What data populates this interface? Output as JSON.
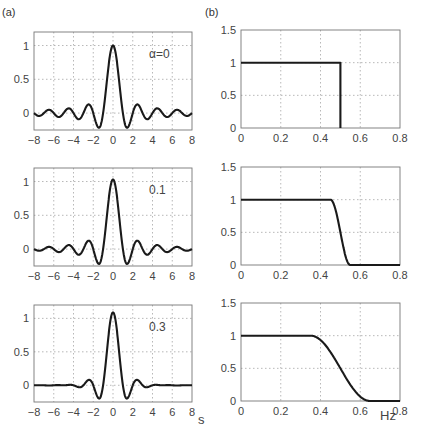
{
  "labels": {
    "panel_a": "(a)",
    "panel_b": "(b)",
    "x_left": "s",
    "x_right": "Hz"
  },
  "chart_data": [
    {
      "id": "a1",
      "type": "line",
      "panel": "(a)",
      "annotation": "α=0",
      "x_ticks": [
        "-8",
        "-6",
        "-4",
        "-2",
        "0",
        "2",
        "4",
        "6",
        "8"
      ],
      "y_ticks": [
        "0",
        "0.5",
        "1"
      ],
      "xlim": [
        -8,
        8
      ],
      "ylim": [
        -0.25,
        1.2
      ],
      "grid": true,
      "alpha": 0,
      "function": "sinc(x) * cos(pi*alpha*x)/(1-(2*alpha*x)^2), impulse response"
    },
    {
      "id": "b1",
      "type": "line",
      "panel": "(b)",
      "x_ticks": [
        "0",
        "0.2",
        "0.4",
        "0.6",
        "0.8"
      ],
      "y_ticks": [
        "0",
        "0.5",
        "1",
        "1.5"
      ],
      "xlim": [
        0,
        0.8
      ],
      "ylim": [
        0,
        1.5
      ],
      "grid": true,
      "alpha": 0,
      "function": "raised-cosine spectrum, cutoff 0.5 Hz"
    },
    {
      "id": "a2",
      "type": "line",
      "annotation": "0.1",
      "x_ticks": [
        "-8",
        "-6",
        "-4",
        "-2",
        "0",
        "2",
        "4",
        "6",
        "8"
      ],
      "y_ticks": [
        "0",
        "0.5",
        "1"
      ],
      "xlim": [
        -8,
        8
      ],
      "ylim": [
        -0.25,
        1.2
      ],
      "grid": true,
      "alpha": 0.1
    },
    {
      "id": "b2",
      "type": "line",
      "x_ticks": [
        "0",
        "0.2",
        "0.4",
        "0.6",
        "0.8"
      ],
      "y_ticks": [
        "0",
        "0.5",
        "1",
        "1.5"
      ],
      "xlim": [
        0,
        0.8
      ],
      "ylim": [
        0,
        1.5
      ],
      "grid": true,
      "alpha": 0.1,
      "transition_band": [
        0.45,
        0.55
      ]
    },
    {
      "id": "a3",
      "type": "line",
      "annotation": "0.3",
      "x_ticks": [
        "-8",
        "-6",
        "-4",
        "-2",
        "0",
        "2",
        "4",
        "6",
        "8"
      ],
      "y_ticks": [
        "0",
        "0.5",
        "1"
      ],
      "xlim": [
        -8,
        8
      ],
      "ylim": [
        -0.25,
        1.2
      ],
      "grid": true,
      "alpha": 0.3,
      "xlabel": "s"
    },
    {
      "id": "b3",
      "type": "line",
      "x_ticks": [
        "0",
        "0.2",
        "0.4",
        "0.6",
        "0.8"
      ],
      "y_ticks": [
        "0",
        "0.5",
        "1",
        "1.5"
      ],
      "xlim": [
        0,
        0.8
      ],
      "ylim": [
        0,
        1.5
      ],
      "grid": true,
      "alpha": 0.3,
      "transition_band": [
        0.35,
        0.65
      ],
      "xlabel": "Hz"
    }
  ]
}
